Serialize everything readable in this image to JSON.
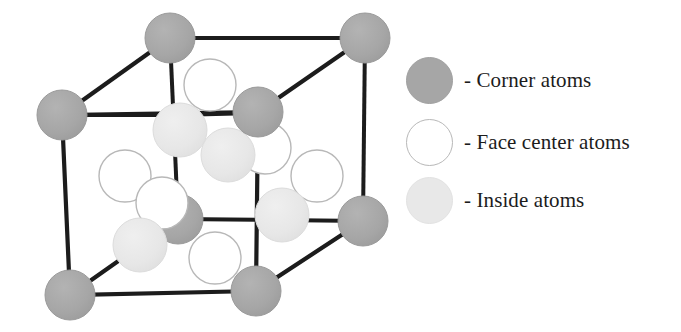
{
  "figure": {
    "name": "crystal-unit-cell-diagram"
  },
  "colors": {
    "corner_atom_fill": "#a6a6a6",
    "corner_atom_stroke": "#9a9a9a",
    "face_atom_fill": "#ffffff",
    "face_atom_stroke": "#b8b8b8",
    "inside_atom_fill": "#e8e8e8",
    "inside_atom_stroke": "#e0e0e0",
    "edge_line": "#1c1c1c",
    "background": "#ffffff",
    "text": "#1c1c1c"
  },
  "cell": {
    "edge_width": 4,
    "corner_atom_radius": 25,
    "face_atom_radius": 26,
    "inside_atom_radius": 27,
    "vertices": {
      "front_top_left": [
        62,
        115
      ],
      "front_top_right": [
        258,
        112
      ],
      "front_bottom_left": [
        70,
        295
      ],
      "front_bottom_right": [
        256,
        291
      ],
      "back_top_left": [
        170,
        38
      ],
      "back_top_right": [
        365,
        38
      ],
      "back_bottom_left": [
        178,
        219
      ],
      "back_bottom_right": [
        363,
        221
      ]
    },
    "edges": [
      [
        "front_top_left",
        "front_top_right"
      ],
      [
        "front_top_right",
        "front_bottom_right"
      ],
      [
        "front_bottom_right",
        "front_bottom_left"
      ],
      [
        "front_bottom_left",
        "front_top_left"
      ],
      [
        "back_top_left",
        "back_top_right"
      ],
      [
        "back_top_right",
        "back_bottom_right"
      ],
      [
        "back_bottom_right",
        "back_bottom_left"
      ],
      [
        "back_bottom_left",
        "back_top_left"
      ],
      [
        "front_top_left",
        "back_top_left"
      ],
      [
        "front_top_right",
        "back_top_right"
      ],
      [
        "front_bottom_right",
        "back_bottom_right"
      ],
      [
        "front_bottom_left",
        "back_bottom_left"
      ]
    ],
    "corner_atoms": [
      {
        "id": "corner-back-top-left",
        "cx": 170,
        "cy": 38
      },
      {
        "id": "corner-back-top-right",
        "cx": 365,
        "cy": 38
      },
      {
        "id": "corner-front-top-left",
        "cx": 62,
        "cy": 115
      },
      {
        "id": "corner-front-top-right",
        "cx": 258,
        "cy": 112
      },
      {
        "id": "corner-back-bottom-right",
        "cx": 363,
        "cy": 221
      },
      {
        "id": "corner-front-bottom-left",
        "cx": 70,
        "cy": 295
      },
      {
        "id": "corner-front-bottom-right",
        "cx": 256,
        "cy": 291
      },
      {
        "id": "corner-back-bottom-left",
        "cx": 178,
        "cy": 219
      }
    ],
    "face_center_atoms": [
      {
        "id": "face-top",
        "cx": 210,
        "cy": 85
      },
      {
        "id": "face-back",
        "cx": 265,
        "cy": 148
      },
      {
        "id": "face-left",
        "cx": 125,
        "cy": 176
      },
      {
        "id": "face-right",
        "cx": 317,
        "cy": 176
      },
      {
        "id": "face-front",
        "cx": 162,
        "cy": 203
      },
      {
        "id": "face-bottom",
        "cx": 215,
        "cy": 258
      }
    ],
    "inside_atoms": [
      {
        "id": "inside-upper-left",
        "cx": 180,
        "cy": 130
      },
      {
        "id": "inside-upper-right",
        "cx": 228,
        "cy": 155
      },
      {
        "id": "inside-lower-right",
        "cx": 282,
        "cy": 215
      },
      {
        "id": "inside-lower-left",
        "cx": 140,
        "cy": 245
      }
    ]
  },
  "legend": {
    "separator": "-",
    "items": [
      {
        "swatch": "corner-atom-swatch",
        "label": "- Corner atoms"
      },
      {
        "swatch": "face-center-atom-swatch",
        "label": "- Face center atoms"
      },
      {
        "swatch": "inside-atom-swatch",
        "label": "- Inside atoms"
      }
    ]
  }
}
